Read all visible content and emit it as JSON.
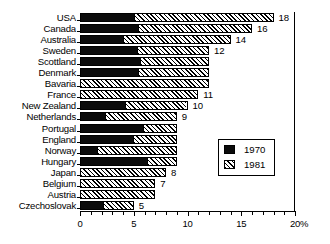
{
  "chart_data": {
    "type": "bar",
    "orientation": "horizontal",
    "stacked_overlay": true,
    "title": "",
    "xlabel": "%",
    "ylabel": "",
    "xlim": [
      0,
      20
    ],
    "xticks": [
      0,
      5,
      10,
      15,
      20
    ],
    "xtick_labels": [
      "0",
      "5",
      "10",
      "15",
      "20"
    ],
    "grid": false,
    "legend_position": "middle-right-inside",
    "categories": [
      "USA",
      "Canada",
      "Australia",
      "Sweden",
      "Scottland",
      "Denmark",
      "Bavaria",
      "France",
      "New Zealand",
      "Netherlands",
      "Portugal",
      "England",
      "Norway",
      "Hungary",
      "Japan",
      "Belgium",
      "Austria",
      "Czechoslovak"
    ],
    "series": [
      {
        "name": "1970",
        "pattern": "solid-black",
        "values": [
          5.0,
          5.4,
          4.0,
          5.3,
          5.6,
          5.4,
          0,
          0,
          4.2,
          2.3,
          5.9,
          4.9,
          1.6,
          6.2,
          0,
          0,
          0,
          2.1
        ]
      },
      {
        "name": "1981",
        "pattern": "hatched",
        "values": [
          18,
          16,
          14,
          12,
          12,
          12,
          12,
          11,
          10,
          9,
          9,
          9,
          9,
          9,
          8,
          7,
          7,
          5
        ]
      }
    ],
    "value_labels": [
      "18",
      "16",
      "14",
      "12",
      "",
      "",
      "",
      "11",
      "10",
      "9",
      "",
      "",
      "",
      "",
      "8",
      "7",
      "",
      "5"
    ]
  },
  "legend": {
    "entries": [
      {
        "label": "1970",
        "swatch": "solid-black"
      },
      {
        "label": "1981",
        "swatch": "hatched"
      }
    ]
  },
  "axis": {
    "unit_label": "%"
  }
}
